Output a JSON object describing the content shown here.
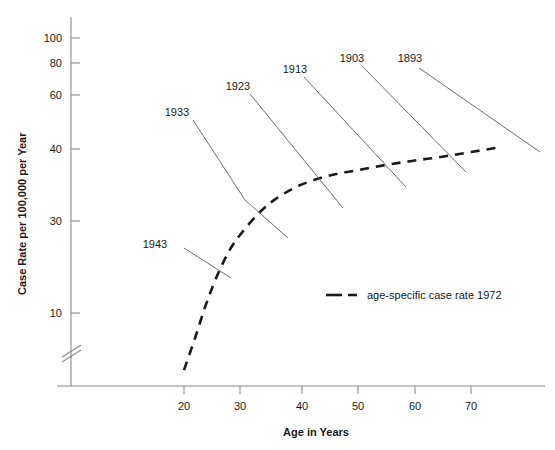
{
  "chart_data": {
    "type": "line",
    "title": "",
    "xlabel": "Age in Years",
    "ylabel": "Case Rate per 100,000 per Year",
    "yscale": "log",
    "y_axis_break": true,
    "xlim": [
      14,
      78
    ],
    "ylim": [
      5,
      115
    ],
    "grid": false,
    "x_ticks": [
      20,
      30,
      40,
      50,
      60,
      70
    ],
    "x_tick_labels": [
      "20",
      "30",
      "40",
      "50",
      "60",
      "70"
    ],
    "y_ticks": [
      10,
      30,
      40,
      60,
      80,
      100
    ],
    "y_tick_labels": [
      "10",
      "30",
      "40",
      "60",
      "80",
      "100"
    ],
    "legend": {
      "position": "inside-center-right",
      "entries": [
        {
          "name": "age-specific case rate 1972",
          "style": "dashed"
        }
      ]
    },
    "series": [
      {
        "name": "age-specific case rate 1972",
        "style": "dashed",
        "x": [
          20,
          22,
          24,
          26,
          28,
          30,
          33,
          36,
          40,
          45,
          50,
          55,
          60,
          65,
          70,
          75
        ],
        "y": [
          6.2,
          8.2,
          11.0,
          14.0,
          17.0,
          19.5,
          23.0,
          26.0,
          29.0,
          31.5,
          33.0,
          34.5,
          35.8,
          37.0,
          38.5,
          40.0
        ]
      }
    ],
    "annotations": [
      {
        "label": "1943",
        "text_x": 155,
        "text_y": 244,
        "leader_to_x": 231,
        "leader_to_y": 278
      },
      {
        "label": "1933",
        "text_x": 177,
        "text_y": 112,
        "leader_to_x": 288,
        "leader_to_y": 238
      },
      {
        "label": "1923",
        "text_x": 238,
        "text_y": 86,
        "leader_to_x": 343,
        "leader_to_y": 208
      },
      {
        "label": "1913",
        "text_x": 295,
        "text_y": 69,
        "leader_to_x": 406,
        "leader_to_y": 187
      },
      {
        "label": "1903",
        "text_x": 352,
        "text_y": 58,
        "leader_to_x": 466,
        "leader_to_y": 172
      },
      {
        "label": "1893",
        "text_x": 410,
        "text_y": 58,
        "leader_to_x": 540,
        "leader_to_y": 152
      }
    ]
  },
  "axes": {
    "x_title": "Age in Years",
    "y_title": "Case Rate per 100,000 per Year"
  },
  "x_ticks": [
    {
      "label": "20"
    },
    {
      "label": "30"
    },
    {
      "label": "40"
    },
    {
      "label": "50"
    },
    {
      "label": "60"
    },
    {
      "label": "70"
    }
  ],
  "y_ticks": [
    {
      "label": "100"
    },
    {
      "label": "80"
    },
    {
      "label": "60"
    },
    {
      "label": "40"
    },
    {
      "label": "30"
    },
    {
      "label": "10"
    }
  ],
  "cohorts": [
    {
      "label": "1933"
    },
    {
      "label": "1923"
    },
    {
      "label": "1913"
    },
    {
      "label": "1903"
    },
    {
      "label": "1893"
    },
    {
      "label": "1943"
    }
  ],
  "legend": {
    "entry_label": "age-specific case rate 1972"
  },
  "colors": {
    "curve": "#1a1a1a",
    "axis": "#8a8a8a",
    "leader": "#6e6e6e",
    "text": "#1a1a1a",
    "background": "#ffffff"
  }
}
